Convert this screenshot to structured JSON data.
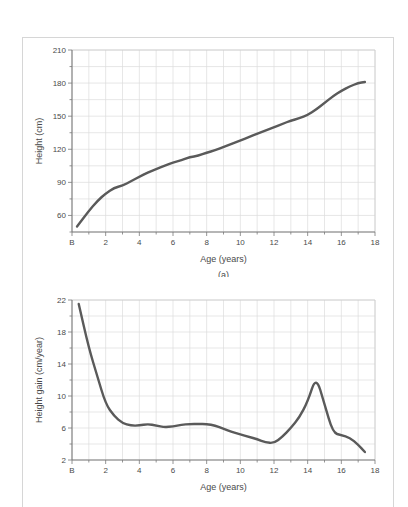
{
  "figure": {
    "caption_a": "(a)",
    "caption_b": ""
  },
  "chart_data": [
    {
      "type": "line",
      "id": "height-distance-curve",
      "title": "",
      "subtitle": "(a)",
      "xlabel": "Age (years)",
      "ylabel": "Height (cm)",
      "xlim": [
        0,
        18
      ],
      "ylim": [
        45,
        210
      ],
      "grid": true,
      "legend": "none",
      "x_tick_labels": [
        "B",
        "2",
        "4",
        "6",
        "8",
        "10",
        "12",
        "14",
        "16",
        "18"
      ],
      "x_tick_values": [
        0,
        2,
        4,
        6,
        8,
        10,
        12,
        14,
        16,
        18
      ],
      "y_tick_labels": [
        "60",
        "90",
        "120",
        "150",
        "180",
        "210"
      ],
      "y_tick_values": [
        60,
        90,
        120,
        150,
        180,
        210
      ],
      "x_minor_step": 1,
      "y_minor_step": 15,
      "line_color": "#5a5a5a",
      "series": [
        {
          "name": "Height",
          "x": [
            0.3,
            0.5,
            1.0,
            1.5,
            2.0,
            2.5,
            3.0,
            3.5,
            4.0,
            4.5,
            5.0,
            5.5,
            6.0,
            6.5,
            7.0,
            7.5,
            8.0,
            8.5,
            9.0,
            9.5,
            10.0,
            10.5,
            11.0,
            11.5,
            12.0,
            12.5,
            13.0,
            13.5,
            14.0,
            14.5,
            15.0,
            15.5,
            16.0,
            16.5,
            17.0,
            17.4
          ],
          "values": [
            50,
            54,
            64,
            73,
            80,
            85,
            87,
            91,
            95,
            99,
            102,
            105,
            108,
            110,
            113,
            114,
            117,
            119,
            122,
            125,
            128,
            131,
            134,
            137,
            140,
            143,
            146,
            148,
            151,
            156,
            162,
            168,
            173,
            177,
            180,
            181
          ]
        }
      ]
    },
    {
      "type": "line",
      "id": "height-gain-velocity-curve",
      "title": "",
      "subtitle": "",
      "xlabel": "Age (years)",
      "ylabel": "Height gain (cm/year)",
      "xlim": [
        0,
        18
      ],
      "ylim": [
        2,
        22
      ],
      "grid": true,
      "legend": "none",
      "x_tick_labels": [
        "B",
        "2",
        "4",
        "6",
        "8",
        "10",
        "12",
        "14",
        "16",
        "18"
      ],
      "x_tick_values": [
        0,
        2,
        4,
        6,
        8,
        10,
        12,
        14,
        16,
        18
      ],
      "y_tick_labels": [
        "2",
        "6",
        "10",
        "14",
        "18",
        "22"
      ],
      "y_tick_values": [
        2,
        6,
        10,
        14,
        18,
        22
      ],
      "x_minor_step": 1,
      "y_minor_step": 2,
      "line_color": "#5a5a5a",
      "series": [
        {
          "name": "Height gain",
          "x": [
            0.4,
            1.0,
            1.5,
            2.0,
            2.5,
            3.0,
            3.5,
            4.0,
            4.5,
            5.0,
            5.5,
            6.0,
            6.5,
            7.0,
            7.5,
            8.0,
            8.5,
            9.0,
            9.5,
            10.0,
            10.5,
            11.0,
            11.5,
            12.0,
            12.5,
            13.0,
            13.5,
            14.0,
            14.5,
            15.0,
            15.5,
            16.0,
            16.5,
            17.0,
            17.4
          ],
          "values": [
            21.5,
            16.0,
            12.5,
            9.0,
            7.5,
            6.6,
            6.3,
            6.3,
            6.5,
            6.3,
            6.1,
            6.2,
            6.4,
            6.5,
            6.5,
            6.5,
            6.3,
            5.9,
            5.5,
            5.2,
            4.9,
            4.6,
            4.2,
            4.1,
            4.9,
            6.0,
            7.3,
            9.3,
            12.5,
            9.0,
            5.4,
            5.1,
            4.8,
            3.9,
            3.0
          ]
        }
      ]
    }
  ]
}
